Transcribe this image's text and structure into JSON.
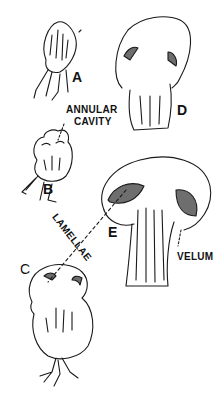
{
  "figure": {
    "labels": {
      "a": "A",
      "b": "B",
      "c": "C",
      "d": "D",
      "e": "E",
      "annular_line1": "ANNULAR",
      "annular_line2": "CAVITY",
      "lamellae": "LAMELLAE",
      "velum": "VELUM"
    },
    "colors": {
      "ink": "#1a1a1a",
      "background": "#ffffff",
      "shade": "#6e6e6e"
    }
  }
}
